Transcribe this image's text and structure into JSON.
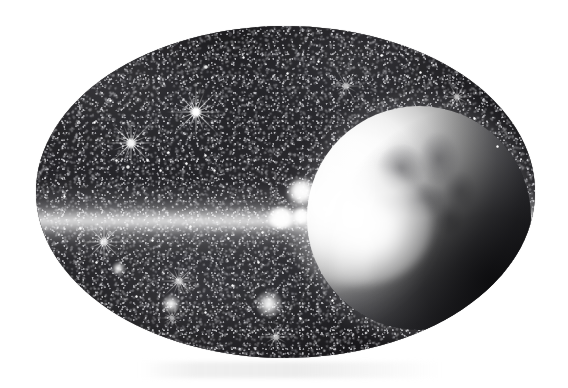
{
  "image": {
    "kind": "space-illustration",
    "medium": "grayscale halftone scan",
    "shape": "oval vignette",
    "caption": "",
    "page_background": "#ffffff",
    "alt_text": "Oval grayscale illustration of a dense starfield with a brightly lit crescent planet at right and a horizontal lens-flare streak across the centre"
  },
  "frame": {
    "name": "oval-vignette",
    "left": 36,
    "top": 26,
    "width": 499,
    "height": 332,
    "rim_color": "#b9b9b9",
    "interior_color": "#1a1a1d"
  },
  "scene": {
    "background_deep_space": "#1a1a1d",
    "highlight_color": "#ffffff",
    "midtone_color": "#6b6b70",
    "planet": {
      "name": "planet-crescent",
      "label": "Planet",
      "center_x": 383,
      "center_y": 192,
      "radius": 112,
      "lit_side": "left",
      "lit_color": "#ffffff",
      "shadow_color": "#161619",
      "surface_texture": "cloud-and-continent mottling"
    },
    "flare": {
      "name": "lens-flare",
      "label": "Lens flare",
      "core_x": 321,
      "core_y": 200,
      "orbs": [
        {
          "x": 245,
          "y": 192,
          "rx": 14,
          "ry": 11
        },
        {
          "x": 265,
          "y": 190,
          "rx": 9,
          "ry": 8
        },
        {
          "x": 265,
          "y": 165,
          "rx": 13,
          "ry": 12
        }
      ]
    },
    "streak": {
      "name": "horizontal-light-streak",
      "label": "Horizontal light streak",
      "center_y": 195,
      "thickness": 78,
      "color": "#ffffff"
    }
  },
  "stars": {
    "label": "Starfield",
    "spiked": [
      {
        "name": "star-upper-left",
        "x": 131,
        "y": 143,
        "size": 54,
        "rays": 8,
        "brightness": 0.95
      },
      {
        "name": "star-upper-mid",
        "x": 196,
        "y": 112,
        "size": 60,
        "rays": 8,
        "brightness": 1.0
      },
      {
        "name": "star-upper-right",
        "x": 346,
        "y": 86,
        "size": 34,
        "rays": 6,
        "brightness": 0.7
      },
      {
        "name": "star-far-upper-right",
        "x": 457,
        "y": 97,
        "size": 32,
        "rays": 6,
        "brightness": 0.7
      },
      {
        "name": "star-lower-left",
        "x": 104,
        "y": 242,
        "size": 46,
        "rays": 8,
        "brightness": 0.85
      },
      {
        "name": "star-lower-mid",
        "x": 179,
        "y": 281,
        "size": 40,
        "rays": 8,
        "brightness": 0.75
      },
      {
        "name": "star-bottom-centre",
        "x": 276,
        "y": 337,
        "size": 34,
        "rays": 6,
        "brightness": 0.7
      },
      {
        "name": "star-bottom-left",
        "x": 172,
        "y": 318,
        "size": 26,
        "rays": 6,
        "brightness": 0.6
      }
    ],
    "glows": [
      {
        "name": "glow-star-lower-centre",
        "x": 269,
        "y": 304,
        "size": 26
      },
      {
        "name": "glow-star-lower-left",
        "x": 171,
        "y": 304,
        "size": 18
      },
      {
        "name": "glow-star-left-mid",
        "x": 118,
        "y": 268,
        "size": 13
      }
    ],
    "points": [
      {
        "x": 116,
        "y": 160,
        "s": 3
      },
      {
        "x": 128,
        "y": 167,
        "s": 4
      },
      {
        "x": 147,
        "y": 160,
        "s": 3
      },
      {
        "x": 160,
        "y": 170,
        "s": 3
      },
      {
        "x": 168,
        "y": 152,
        "s": 3
      },
      {
        "x": 186,
        "y": 163,
        "s": 3
      },
      {
        "x": 205,
        "y": 155,
        "s": 3
      },
      {
        "x": 214,
        "y": 170,
        "s": 3
      },
      {
        "x": 94,
        "y": 122,
        "s": 3
      },
      {
        "x": 110,
        "y": 100,
        "s": 3
      },
      {
        "x": 158,
        "y": 78,
        "s": 3
      },
      {
        "x": 206,
        "y": 67,
        "s": 4
      },
      {
        "x": 243,
        "y": 57,
        "s": 3
      },
      {
        "x": 287,
        "y": 73,
        "s": 3
      },
      {
        "x": 318,
        "y": 61,
        "s": 3
      },
      {
        "x": 381,
        "y": 55,
        "s": 3
      },
      {
        "x": 420,
        "y": 72,
        "s": 3
      },
      {
        "x": 474,
        "y": 118,
        "s": 3
      },
      {
        "x": 497,
        "y": 146,
        "s": 3
      },
      {
        "x": 64,
        "y": 196,
        "s": 3
      },
      {
        "x": 80,
        "y": 228,
        "s": 3
      },
      {
        "x": 96,
        "y": 262,
        "s": 3
      },
      {
        "x": 136,
        "y": 296,
        "s": 3
      },
      {
        "x": 205,
        "y": 312,
        "s": 3
      },
      {
        "x": 232,
        "y": 285,
        "s": 3
      },
      {
        "x": 258,
        "y": 262,
        "s": 3
      },
      {
        "x": 300,
        "y": 318,
        "s": 3
      },
      {
        "x": 332,
        "y": 300,
        "s": 3
      },
      {
        "x": 152,
        "y": 240,
        "s": 3
      },
      {
        "x": 190,
        "y": 226,
        "s": 3
      },
      {
        "x": 228,
        "y": 238,
        "s": 3
      },
      {
        "x": 262,
        "y": 232,
        "s": 3
      }
    ]
  }
}
